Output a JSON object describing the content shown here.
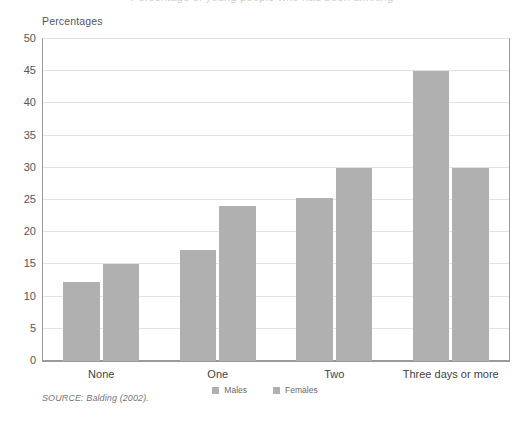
{
  "figure": {
    "clipped_title": "Percentage of young people who had been drinking",
    "axis_unit_label": "Percentages",
    "source_note": "SOURCE: Balding (2002)."
  },
  "legend": {
    "items": [
      {
        "label": "Males",
        "color": "#b0b0b0"
      },
      {
        "label": "Females",
        "color": "#b0b0b0"
      }
    ]
  },
  "chart_data": {
    "type": "bar",
    "title": "",
    "xlabel": "",
    "ylabel": "Percentages",
    "categories": [
      "None",
      "One",
      "Two",
      "Three days or more"
    ],
    "series": [
      {
        "name": "Males",
        "values": [
          12.3,
          17.3,
          25.3,
          45.0
        ],
        "color": "#b0b0b0"
      },
      {
        "name": "Females",
        "values": [
          15.0,
          24.0,
          30.0,
          30.0
        ],
        "color": "#b0b0b0"
      }
    ],
    "ylim": [
      0,
      50
    ],
    "yticks": [
      0,
      5,
      10,
      15,
      20,
      25,
      30,
      35,
      40,
      45,
      50
    ],
    "ytick_labels": [
      "0",
      "5",
      "10",
      "15",
      "20",
      "25",
      "30",
      "35",
      "40",
      "45",
      "50"
    ],
    "grid": true,
    "grid_axis": "y",
    "grid_color": "#e2e2e2",
    "legend_position": "bottom",
    "frame": true,
    "frame_color": "#9a9a9a"
  }
}
